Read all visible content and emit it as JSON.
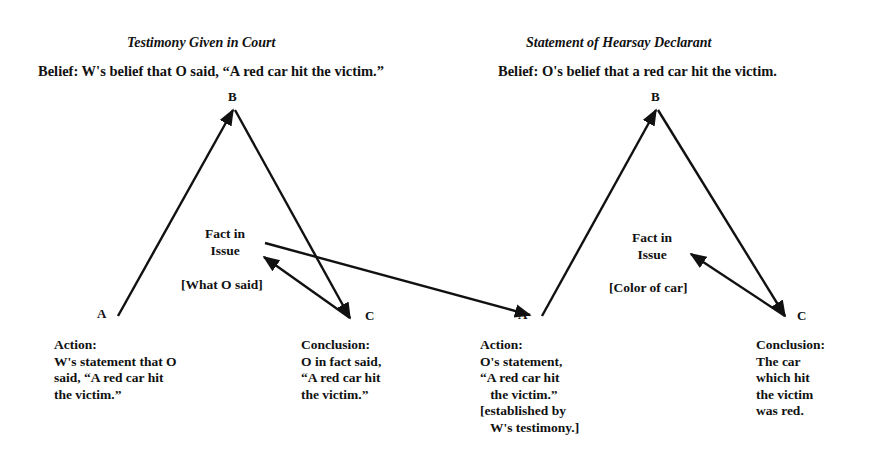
{
  "left_panel": {
    "title": "Testimony Given in Court",
    "belief": "Belief:  W's belief that O said, “A red car hit the victim.”",
    "vertex_b": "B",
    "vertex_a": "A",
    "vertex_c": "C",
    "fact_in_issue_line1": "Fact in",
    "fact_in_issue_line2": "Issue",
    "fact_label": "[What O said]",
    "action": "Action:\nW's statement that O\nsaid, “A red car hit\nthe victim.”",
    "conclusion": "Conclusion:\nO in fact said,\n“A red car hit\nthe victim.”"
  },
  "right_panel": {
    "title": "Statement of Hearsay Declarant",
    "belief": "Belief:  O's belief that a red car hit the victim.",
    "vertex_b": "B",
    "vertex_a": "A",
    "vertex_c": "C",
    "fact_in_issue_line1": "Fact in",
    "fact_in_issue_line2": "Issue",
    "fact_label": "[Color of car]",
    "action": "Action:\nO's statement,\n“A red car hit\n   the victim.”\n[established by\n   W's testimony.]",
    "conclusion": "Conclusion:\nThe car\nwhich hit\nthe victim\nwas red."
  },
  "diagram": {
    "left_triangle": {
      "A": [
        118,
        316
      ],
      "B": [
        234,
        108
      ],
      "C": [
        351,
        319
      ]
    },
    "right_triangle": {
      "A": [
        542,
        316
      ],
      "B": [
        657,
        108
      ],
      "C": [
        786,
        317
      ]
    },
    "connector": {
      "from": [
        265,
        243
      ],
      "to": [
        532,
        315
      ]
    },
    "line_color": "#111111"
  }
}
